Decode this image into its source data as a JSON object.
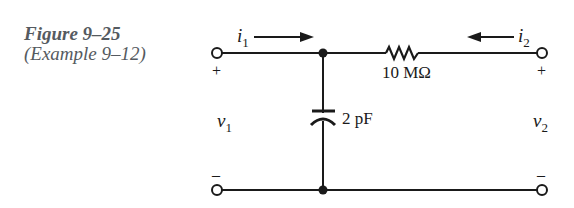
{
  "caption": {
    "figure": "Figure 9–25",
    "example": "(Example 9–12)"
  },
  "circuit": {
    "current_left": {
      "symbol": "i",
      "subscript": "1",
      "direction": "right"
    },
    "current_right": {
      "symbol": "i",
      "subscript": "2",
      "direction": "left"
    },
    "resistor_label": "10 MΩ",
    "capacitor_label": "2 pF",
    "voltage_left": {
      "symbol": "v",
      "subscript": "1"
    },
    "voltage_right": {
      "symbol": "v",
      "subscript": "2"
    },
    "plus": "+",
    "minus": "–"
  },
  "colors": {
    "ink": "#1a1a1a",
    "caption": "#555a60"
  }
}
